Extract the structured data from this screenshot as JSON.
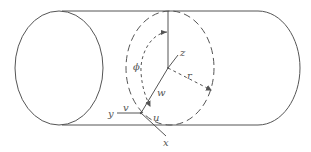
{
  "figure": {
    "type": "cylinder-coordinate-diagram",
    "colors": {
      "stroke": "#555555",
      "background": "#ffffff"
    },
    "labels": {
      "z": "z",
      "phi": "ϕ",
      "r": "r",
      "w": "w",
      "v": "v",
      "y": "y",
      "u": "u",
      "x": "x"
    }
  }
}
